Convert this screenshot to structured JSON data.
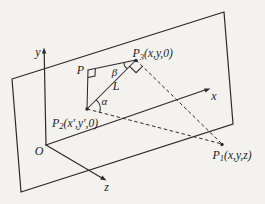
{
  "figure": {
    "colors": {
      "ink": "#2a2a2a",
      "paper": "#f3f2ee"
    },
    "axis_labels": {
      "x": "x",
      "y": "y",
      "z": "z"
    },
    "origin_label": "O",
    "point_labels": {
      "p": "P",
      "p1": {
        "base": "P",
        "sub": "1",
        "args": "(x,y,z)"
      },
      "p2": {
        "base": "P",
        "sub": "2",
        "args": "(x′,y′,0)"
      },
      "p3": {
        "base": "P",
        "sub": "3",
        "args": "(x,y,0)"
      }
    },
    "segment_labels": {
      "l": "L"
    },
    "angle_labels": {
      "alpha": "α",
      "beta": "β"
    }
  }
}
